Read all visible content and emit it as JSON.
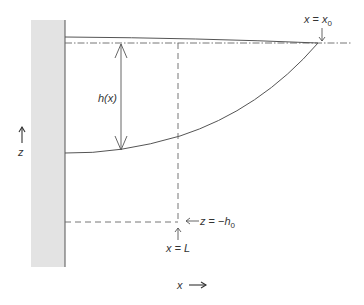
{
  "diagram": {
    "title": "",
    "labels": {
      "h_x": "h(x)",
      "x_eq_x0_var": "x",
      "x_eq_x0_eq": " = ",
      "x_eq_x0_rhs": "x",
      "x_eq_x0_sub": "0",
      "z_eq_var": "z",
      "z_eq_eq": " = −",
      "z_eq_rhs": "h",
      "z_eq_sub": "0",
      "x_eq_L": "x = L",
      "z_axis": "z",
      "x_axis": "x"
    },
    "colors": {
      "wall_fill": "#e3e3e3",
      "line": "#555555",
      "text": "#333333"
    },
    "elements": [
      {
        "type": "wall",
        "description": "shaded vertical wall on left"
      },
      {
        "type": "curve",
        "description": "upper surface, nearly flat solid line from wall to x = x0"
      },
      {
        "type": "curve",
        "description": "lower surface, parabolic-like solid curve from wall to x = x0"
      },
      {
        "type": "line",
        "style": "dash-dot",
        "description": "reference level z = 0"
      },
      {
        "type": "line",
        "style": "dashed",
        "description": "vertical at x = L down to z = -h0"
      },
      {
        "type": "line",
        "style": "dashed",
        "description": "horizontal at z = -h0"
      },
      {
        "type": "arrow",
        "style": "double",
        "description": "thickness h(x)"
      }
    ]
  }
}
